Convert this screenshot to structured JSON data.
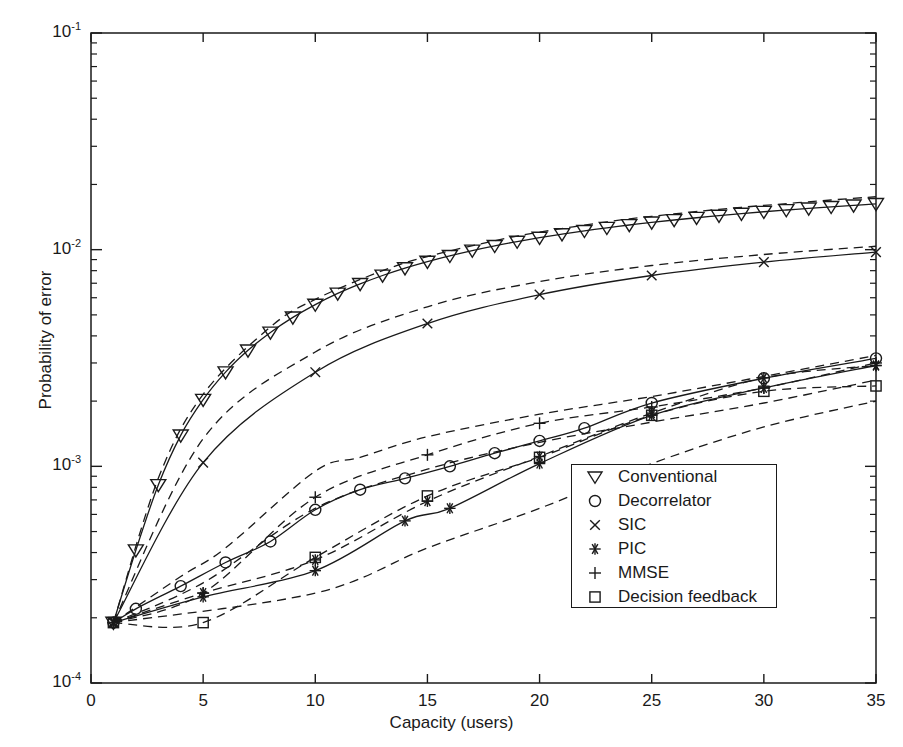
{
  "chart_data": {
    "type": "line",
    "title": "",
    "xlabel": "Capacity (users)",
    "ylabel": "Probability of error",
    "xlim": [
      0,
      35
    ],
    "ylim": [
      0.0001,
      0.1
    ],
    "yscale": "log",
    "xscale": "linear",
    "xticks": [
      0,
      5,
      10,
      15,
      20,
      25,
      30,
      35
    ],
    "xtick_labels": [
      "0",
      "5",
      "10",
      "15",
      "20",
      "25",
      "30",
      "35"
    ],
    "yticks": [
      0.0001,
      0.001,
      0.01,
      0.1
    ],
    "ytick_labels": [
      "10-4",
      "10-3",
      "10-2",
      "10-1"
    ],
    "ytick_mantissa": "10",
    "grid": false,
    "legend_position": "lower right",
    "line_color": "#1a1a1a",
    "series": [
      {
        "name": "Conventional",
        "marker": "triangle-down",
        "linestyle": "solid",
        "x": [
          1,
          2,
          3,
          4,
          5,
          6,
          7,
          8,
          9,
          10,
          11,
          12,
          13,
          14,
          15,
          16,
          17,
          18,
          19,
          20,
          21,
          22,
          23,
          24,
          25,
          26,
          27,
          28,
          29,
          30,
          31,
          32,
          33,
          34,
          35
        ],
        "y": [
          0.00019,
          0.00041,
          0.00082,
          0.00139,
          0.00203,
          0.00272,
          0.00343,
          0.00415,
          0.00487,
          0.00558,
          0.00628,
          0.00695,
          0.0076,
          0.00822,
          0.00881,
          0.00937,
          0.00991,
          0.01042,
          0.0109,
          0.01136,
          0.0118,
          0.01222,
          0.01262,
          0.013,
          0.01336,
          0.01371,
          0.01404,
          0.01436,
          0.01467,
          0.01496,
          0.01524,
          0.01551,
          0.01577,
          0.01602,
          0.01627
        ]
      },
      {
        "name": "Conventional",
        "marker": "none",
        "linestyle": "dashed",
        "x": [
          1,
          3,
          5,
          8,
          10,
          13,
          15,
          18,
          20,
          23,
          25,
          28,
          30,
          33,
          35
        ],
        "y": [
          0.00019,
          0.00088,
          0.00215,
          0.0044,
          0.0059,
          0.008,
          0.0093,
          0.011,
          0.01205,
          0.01345,
          0.01425,
          0.01535,
          0.016,
          0.01695,
          0.01755
        ]
      },
      {
        "name": "SIC",
        "marker": "x",
        "linestyle": "solid",
        "x": [
          1,
          5,
          10,
          15,
          20,
          25,
          30,
          35
        ],
        "y": [
          0.00019,
          0.00104,
          0.00272,
          0.00456,
          0.0062,
          0.0076,
          0.00876,
          0.00974
        ]
      },
      {
        "name": "SIC",
        "marker": "none",
        "linestyle": "dashed",
        "x": [
          1,
          5,
          10,
          15,
          20,
          25,
          30,
          35
        ],
        "y": [
          0.00019,
          0.00134,
          0.00337,
          0.00545,
          0.00712,
          0.00845,
          0.0095,
          0.01037
        ]
      },
      {
        "name": "Decorrelator",
        "marker": "circle",
        "linestyle": "solid",
        "x": [
          1,
          2,
          4,
          6,
          8,
          10,
          12,
          14,
          16,
          18,
          20,
          22,
          25,
          30,
          35
        ],
        "y": [
          0.00019,
          0.00022,
          0.00028,
          0.00036,
          0.00045,
          0.00063,
          0.00078,
          0.00088,
          0.001,
          0.00115,
          0.00131,
          0.0015,
          0.00196,
          0.00255,
          0.00315
        ]
      },
      {
        "name": "Decorrelator",
        "marker": "none",
        "linestyle": "dashed",
        "x": [
          1,
          4,
          6,
          10,
          12,
          15,
          20,
          25,
          30,
          35
        ],
        "y": [
          0.00019,
          0.00031,
          0.00042,
          0.00095,
          0.0011,
          0.00137,
          0.00174,
          0.0021,
          0.0026,
          0.00325
        ]
      },
      {
        "name": "MMSE",
        "marker": "plus",
        "linestyle": "dashed",
        "x": [
          1,
          5,
          10,
          15,
          20,
          25,
          30,
          35
        ],
        "y": [
          0.00019,
          0.00026,
          0.00072,
          0.00113,
          0.00158,
          0.00188,
          0.0023,
          0.003
        ]
      },
      {
        "name": "MMSE",
        "marker": "none",
        "linestyle": "dashed",
        "x": [
          1,
          5,
          10,
          15,
          20,
          25,
          30,
          35
        ],
        "y": [
          0.00019,
          0.00029,
          0.00064,
          0.00097,
          0.00129,
          0.0016,
          0.00196,
          0.0025
        ]
      },
      {
        "name": "PIC",
        "marker": "asterisk",
        "linestyle": "solid",
        "x": [
          1,
          5,
          10,
          14,
          16,
          20,
          25,
          30,
          35
        ],
        "y": [
          0.00019,
          0.00025,
          0.00033,
          0.00056,
          0.00064,
          0.00103,
          0.00172,
          0.0023,
          0.00292
        ]
      },
      {
        "name": "PIC",
        "marker": "asterisk",
        "linestyle": "dashed",
        "x": [
          1,
          5,
          10,
          15,
          20,
          25,
          30,
          35
        ],
        "y": [
          0.00019,
          0.00026,
          0.00037,
          0.00069,
          0.00111,
          0.00176,
          0.00256,
          0.00292
        ]
      },
      {
        "name": "Decision feedback",
        "marker": "square",
        "linestyle": "dashed",
        "x": [
          1,
          5,
          10,
          15,
          20,
          25,
          30,
          35
        ],
        "y": [
          0.00019,
          0.00019,
          0.00038,
          0.00073,
          0.0011,
          0.00172,
          0.00222,
          0.00235
        ]
      },
      {
        "name": "Decision feedback",
        "marker": "none",
        "linestyle": "dashed",
        "x": [
          1,
          10,
          15,
          20,
          25,
          30,
          35
        ],
        "y": [
          0.00019,
          0.00026,
          0.00042,
          0.00064,
          0.00103,
          0.00152,
          0.002
        ]
      }
    ],
    "legend": [
      {
        "label": "Conventional",
        "marker": "triangle-down"
      },
      {
        "label": "Decorrelator",
        "marker": "circle"
      },
      {
        "label": "SIC",
        "marker": "x"
      },
      {
        "label": "PIC",
        "marker": "asterisk"
      },
      {
        "label": "MMSE",
        "marker": "plus"
      },
      {
        "label": "Decision feedback",
        "marker": "square"
      }
    ]
  },
  "axes": {
    "xlabel": "Capacity (users)",
    "ylabel": "Probability of error",
    "xticks": [
      {
        "label": "0",
        "value": 0
      },
      {
        "label": "5",
        "value": 5
      },
      {
        "label": "10",
        "value": 10
      },
      {
        "label": "15",
        "value": 15
      },
      {
        "label": "20",
        "value": 20
      },
      {
        "label": "25",
        "value": 25
      },
      {
        "label": "30",
        "value": 30
      },
      {
        "label": "35",
        "value": 35
      }
    ],
    "yticks": [
      {
        "base": "10",
        "exp": "-1",
        "value": 0.1
      },
      {
        "base": "10",
        "exp": "-2",
        "value": 0.01
      },
      {
        "base": "10",
        "exp": "-3",
        "value": 0.001
      },
      {
        "base": "10",
        "exp": "-4",
        "value": 0.0001
      }
    ]
  },
  "legend": {
    "items": [
      {
        "label": "Conventional",
        "marker": "triangle-down-icon"
      },
      {
        "label": "Decorrelator",
        "marker": "circle-icon"
      },
      {
        "label": "SIC",
        "marker": "x-icon"
      },
      {
        "label": "PIC",
        "marker": "asterisk-icon"
      },
      {
        "label": "MMSE",
        "marker": "plus-icon"
      },
      {
        "label": "Decision feedback",
        "marker": "square-icon"
      }
    ]
  }
}
